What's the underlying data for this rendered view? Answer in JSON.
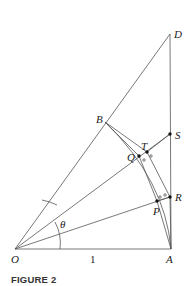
{
  "figure": {
    "caption": "FIGURE 2",
    "angle_label": "θ",
    "length_label": "1",
    "points": {
      "O": "O",
      "A": "A",
      "B": "B",
      "D": "D",
      "S": "S",
      "R": "R",
      "T": "T",
      "Q": "Q",
      "P": "P"
    },
    "colors": {
      "line": "#555555",
      "text": "#222222",
      "dot": "#111111"
    }
  }
}
